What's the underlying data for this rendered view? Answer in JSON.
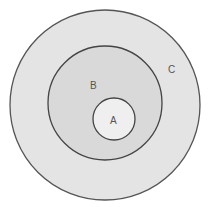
{
  "diagram": {
    "type": "nested-sets",
    "sets": [
      {
        "id": "C",
        "label": "C",
        "fill": "#e4e4e4",
        "stroke": "#555555"
      },
      {
        "id": "B",
        "label": "B",
        "fill": "#d9d9d9",
        "stroke": "#444444"
      },
      {
        "id": "A",
        "label": "A",
        "fill": "#efefef",
        "stroke": "#444444"
      }
    ],
    "relations": [
      "A subset of B",
      "B subset of C"
    ]
  }
}
